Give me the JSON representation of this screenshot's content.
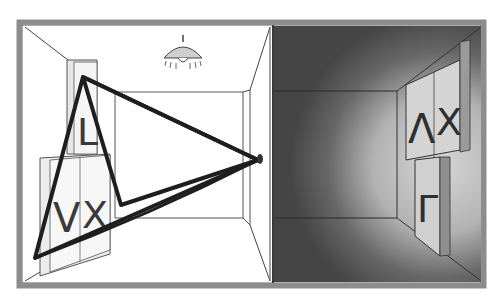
{
  "illustration": {
    "description": "Two adjoining rooms: a lit room with wall signs viewed through a pinhole, and a dark room showing the projected, inverted signs",
    "left_room": {
      "name": "lit room",
      "lamp": "ceiling-lamp",
      "signs": {
        "upper": "L",
        "lower_left": "V",
        "lower_right": "X"
      },
      "pinhole": "pinhole-aperture"
    },
    "right_room": {
      "name": "dark room",
      "signs": {
        "upper_left": "Λ",
        "upper_right": "X",
        "lower": "Γ"
      }
    },
    "colors": {
      "ink": "#1e1e1e",
      "frame": "#9a9a9a",
      "dark_room": "#4a4a4a",
      "sign_fill": "#d8d8d8",
      "paper": "#ffffff"
    }
  }
}
